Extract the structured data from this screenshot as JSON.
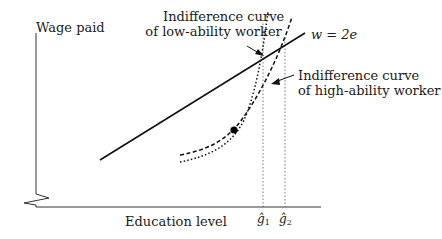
{
  "diagram": {
    "axes": {
      "y_label": "Wage paid",
      "x_label": "Education level",
      "axis_break": "zigzag on vertical axis"
    },
    "line": {
      "label": "w = 2e",
      "style": "solid"
    },
    "curves": [
      {
        "label_line1": "Indifference curve",
        "label_line2": "of low-ability worker",
        "style": "dotted"
      },
      {
        "label_line1": "Indifference curve",
        "label_line2": "of high-ability worker",
        "style": "dashed"
      }
    ],
    "x_markers": [
      {
        "symbol": "ĝ",
        "subscript": "1"
      },
      {
        "symbol": "ĝ",
        "subscript": "2"
      }
    ],
    "point": "filled dot where the two indifference curves are tangent/intersect",
    "colors": {
      "ink": "#1a1a1a",
      "background": "#ffffff",
      "guide": "#555555"
    }
  }
}
